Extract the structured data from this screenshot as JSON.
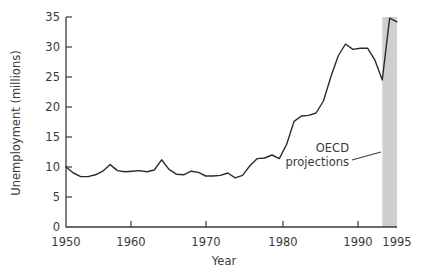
{
  "chart_data": {
    "type": "line",
    "title": "",
    "xlabel": "Year",
    "ylabel": "Unemployment (millions)",
    "xlim": [
      1950,
      1995
    ],
    "ylim": [
      0,
      35
    ],
    "grid": false,
    "legend": null,
    "xticks": [
      1950,
      1960,
      1970,
      1980,
      1990,
      1995
    ],
    "xtick_labels": [
      "1950",
      "1960",
      "1970",
      "1980",
      "1990",
      "1995"
    ],
    "xticks_minor": [
      1955,
      1965,
      1975,
      1985
    ],
    "yticks": [
      0,
      5,
      10,
      15,
      20,
      25,
      30,
      35
    ],
    "ytick_labels": [
      "0",
      "5",
      "10",
      "15",
      "20",
      "25",
      "30",
      "35"
    ],
    "line_color": "#2b2b2b",
    "shade_color": "#cfcfcf",
    "series": [
      {
        "name": "Unemployment",
        "x": [
          1950,
          1951,
          1952,
          1953,
          1954,
          1955,
          1956,
          1957,
          1958,
          1959,
          1960,
          1961,
          1962,
          1963,
          1964,
          1965,
          1966,
          1967,
          1968,
          1969,
          1970,
          1971,
          1972,
          1973,
          1974,
          1975,
          1976,
          1977,
          1978,
          1979,
          1980,
          1981,
          1982,
          1983,
          1984,
          1985,
          1986,
          1987,
          1988,
          1989,
          1990,
          1991,
          1992,
          1993,
          1994,
          1995
        ],
        "values": [
          10.0,
          9.0,
          8.4,
          8.4,
          8.7,
          9.3,
          10.4,
          9.4,
          9.2,
          9.3,
          9.4,
          9.2,
          9.5,
          11.2,
          9.6,
          8.8,
          8.7,
          9.3,
          9.1,
          8.5,
          8.5,
          8.6,
          9.0,
          8.2,
          8.6,
          10.2,
          11.4,
          11.5,
          12.0,
          11.4,
          13.8,
          17.6,
          18.5,
          18.6,
          19.0,
          21.0,
          25.0,
          28.5,
          30.5,
          29.6,
          29.8,
          29.8,
          27.8,
          24.5,
          25.5,
          30.0
        ]
      }
    ],
    "annotations": [
      {
        "text_line_1": "OECD",
        "text_line_2": "projections",
        "points_to_x": 1993.6,
        "shaded_band": {
          "from": 1993.0,
          "to": 1995.0,
          "label": "OECD projections"
        }
      }
    ],
    "projection_segment": {
      "x": [
        1993,
        1994,
        1995
      ],
      "values": [
        24.5,
        34.8,
        34.2
      ]
    }
  }
}
